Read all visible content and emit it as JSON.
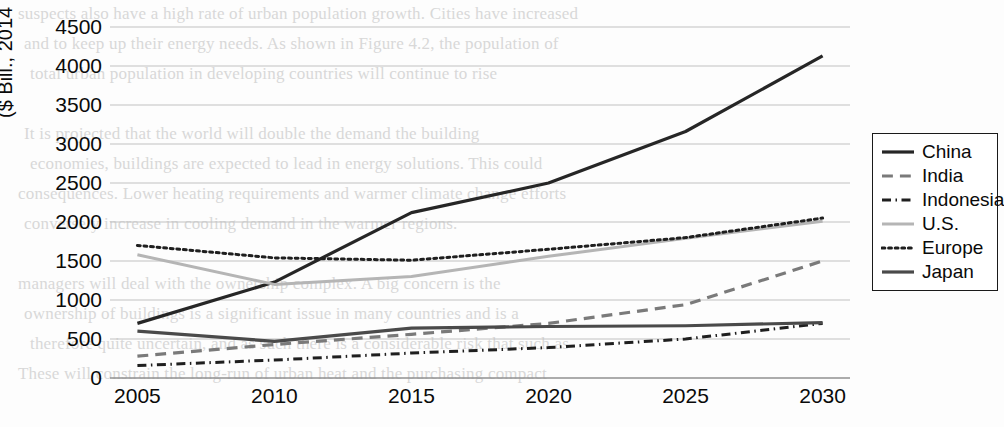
{
  "figure": {
    "background_bleed_text": [
      "suspects also have a high rate of urban population growth. Cities have increased",
      "and to keep up their energy needs. As shown in Figure 4.2, the population of",
      "total urban population in developing countries will continue to rise",
      "",
      "It is projected that the world will double the demand the building",
      "economies, buildings are expected to lead in energy solutions. This could",
      "consequences. Lower heating requirements and warmer climate change efforts",
      "conversely increase in cooling demand in the warmer regions.",
      "",
      "managers will deal with the ownership complex. A big concern is the",
      "ownership of buildings is a significant issue in many countries and is a",
      "therefore quite uncertain, and as such there is a considerable risk that such as",
      "These will constrain the long-run of urban heat and the purchasing compact"
    ]
  },
  "chart_data": {
    "type": "line",
    "title": "",
    "xlabel": "",
    "ylabel": "($ Bill., 2014 prices)",
    "x": [
      2005,
      2010,
      2015,
      2020,
      2025,
      2030
    ],
    "xlim": [
      2004,
      2031
    ],
    "ylim": [
      0,
      4500
    ],
    "yticks": [
      0,
      500,
      1000,
      1500,
      2000,
      2500,
      3000,
      3500,
      4000,
      4500
    ],
    "xticks": [
      2005,
      2010,
      2015,
      2020,
      2025,
      2030
    ],
    "grid": true,
    "legend_position": "right",
    "series": [
      {
        "name": "China",
        "values": [
          700,
          1230,
          2120,
          2500,
          3160,
          4130
        ],
        "color": "#262626",
        "width": 3.2,
        "dash": "none"
      },
      {
        "name": "India",
        "values": [
          280,
          430,
          560,
          700,
          940,
          1500
        ],
        "color": "#7a7a7a",
        "width": 3.2,
        "dash": "dashed"
      },
      {
        "name": "Indonesia",
        "values": [
          160,
          230,
          320,
          390,
          500,
          700
        ],
        "color": "#1f1f1f",
        "width": 3.0,
        "dash": "dashdot"
      },
      {
        "name": "U.S.",
        "values": [
          1580,
          1200,
          1300,
          1560,
          1790,
          2010
        ],
        "color": "#b5b5b5",
        "width": 3.0,
        "dash": "none"
      },
      {
        "name": "Europe",
        "values": [
          1700,
          1540,
          1510,
          1650,
          1800,
          2050
        ],
        "color": "#1f1f1f",
        "width": 3.0,
        "dash": "dotted"
      },
      {
        "name": "Japan",
        "values": [
          600,
          470,
          640,
          660,
          670,
          710
        ],
        "color": "#4a4a4a",
        "width": 3.2,
        "dash": "none"
      }
    ]
  }
}
